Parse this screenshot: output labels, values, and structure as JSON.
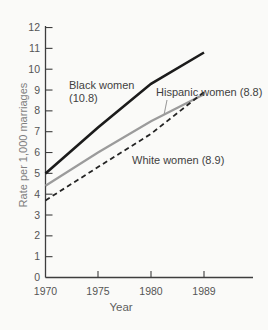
{
  "chart_data": {
    "type": "line",
    "title": "",
    "xlabel": "Year",
    "ylabel": "Rate per 1,000 marriages",
    "categories": [
      1970,
      1975,
      1980,
      1989
    ],
    "x_tick_labels": [
      "1970",
      "1975",
      "1980",
      "1989"
    ],
    "y_tick_labels": [
      "0",
      "1",
      "2",
      "3",
      "4",
      "5",
      "6",
      "7",
      "8",
      "9",
      "10",
      "11",
      "12"
    ],
    "ylim": [
      0,
      12
    ],
    "grid": false,
    "legend_position": "inline-annotations",
    "series": [
      {
        "name": "Hispanic women",
        "values": [
          4.4,
          6.0,
          7.5,
          8.8
        ],
        "final_value": 8.8,
        "color": "#9b9b9b",
        "style": "solid"
      },
      {
        "name": "White women",
        "values": [
          3.7,
          5.3,
          6.9,
          8.9
        ],
        "final_value": 8.9,
        "color": "#242424",
        "style": "dashed"
      },
      {
        "name": "Black women",
        "values": [
          5.0,
          7.2,
          9.3,
          10.8
        ],
        "final_value": 10.8,
        "color": "#1b1b1b",
        "style": "solid"
      }
    ]
  },
  "labels": {
    "black_line1": "Black women",
    "black_line2": "(10.8)",
    "hispanic_label": "Hispanic women (8.8)",
    "white_label": "White women (8.9)"
  }
}
